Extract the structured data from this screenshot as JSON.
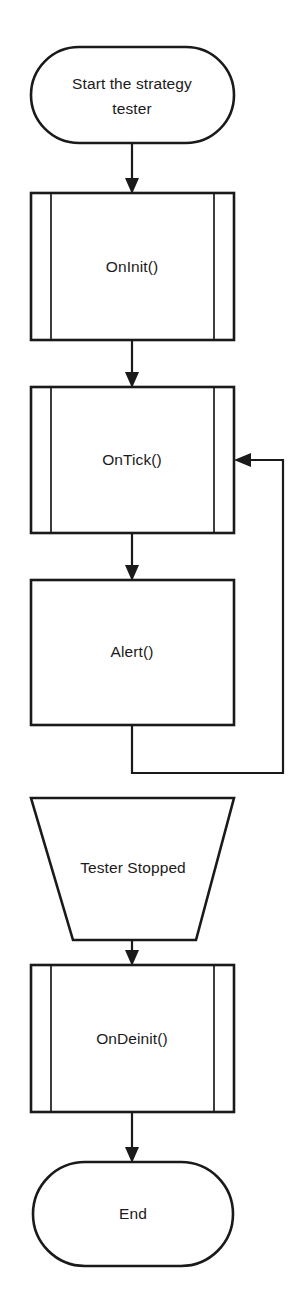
{
  "diagram": {
    "background_color": "#ffffff",
    "line_color": "#1a1a1a",
    "fill_color": "#ffffff"
  },
  "nodes": {
    "start": {
      "label_line1": "Start the strategy",
      "label_line2": "tester",
      "shape": "stadium"
    },
    "oninit": {
      "label": "OnInit()",
      "shape": "predefined-process"
    },
    "ontick": {
      "label": "OnTick()",
      "shape": "predefined-process"
    },
    "alert": {
      "label": "Alert()",
      "shape": "rectangle"
    },
    "tester_stopped": {
      "label": "Tester Stopped",
      "shape": "inverted-trapezoid"
    },
    "ondeinit": {
      "label": "OnDeinit()",
      "shape": "predefined-process"
    },
    "end": {
      "label": "End",
      "shape": "stadium"
    }
  },
  "edges": [
    {
      "name": "start-to-oninit",
      "from": "start",
      "to": "oninit",
      "label": ""
    },
    {
      "name": "oninit-to-ontick",
      "from": "oninit",
      "to": "ontick",
      "label": ""
    },
    {
      "name": "ontick-to-alert",
      "from": "ontick",
      "to": "alert",
      "label": ""
    },
    {
      "name": "alert-to-ontick-loop",
      "from": "alert",
      "to": "ontick",
      "label": ""
    },
    {
      "name": "tester-stopped-to-ondeinit",
      "from": "tester_stopped",
      "to": "ondeinit",
      "label": ""
    },
    {
      "name": "ondeinit-to-end",
      "from": "ondeinit",
      "to": "end",
      "label": ""
    }
  ]
}
